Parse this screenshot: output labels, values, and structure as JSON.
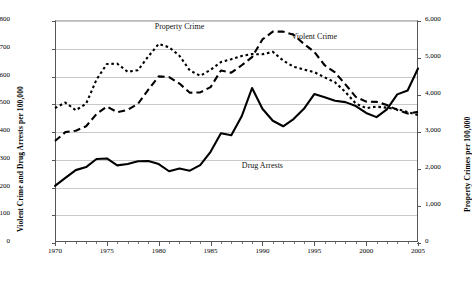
{
  "chart_data": {
    "type": "line",
    "title": "",
    "xlabel": "",
    "ylabel": "Violent Crime and Drug Arrests per 100,000",
    "y2label": "Property Crimes per 100,000",
    "xlim": [
      1970,
      2005
    ],
    "ylim": [
      0,
      800
    ],
    "y2lim": [
      0,
      6000
    ],
    "grid": true,
    "legend": "inline-annotations",
    "xticks": [
      1970,
      1975,
      1980,
      1985,
      1990,
      1995,
      2000,
      2005
    ],
    "xtick_labels": [
      "1970",
      "1975",
      "1980",
      "1985",
      "1990",
      "1995",
      "2000",
      "2005"
    ],
    "xtick_minor_step": 1,
    "yticks": [
      0,
      100,
      200,
      300,
      400,
      500,
      600,
      700,
      800
    ],
    "ytick_labels": [
      "0",
      "100",
      "200",
      "300",
      "400",
      "500",
      "600",
      "700",
      "800"
    ],
    "y2ticks": [
      0,
      1000,
      2000,
      3000,
      4000,
      5000,
      6000
    ],
    "y2tick_labels": [
      "0",
      "1,000",
      "2,000",
      "3,000",
      "4,000",
      "5,000",
      "6,000"
    ],
    "x": [
      1970,
      1971,
      1972,
      1973,
      1974,
      1975,
      1976,
      1977,
      1978,
      1979,
      1980,
      1981,
      1982,
      1983,
      1984,
      1985,
      1986,
      1987,
      1988,
      1989,
      1990,
      1991,
      1992,
      1993,
      1994,
      1995,
      1996,
      1997,
      1998,
      1999,
      2000,
      2001,
      2002,
      2003,
      2004,
      2005
    ],
    "series": [
      {
        "name": "Property Crime",
        "axis": "right",
        "style": "dotted",
        "units": "per 100,000",
        "values": [
          3621,
          3769,
          3561,
          3737,
          4390,
          4811,
          4820,
          4602,
          4643,
          5017,
          5353,
          5264,
          5033,
          4637,
          4492,
          4651,
          4863,
          4940,
          5027,
          5078,
          5073,
          5140,
          4903,
          4738,
          4660,
          4591,
          4451,
          4316,
          4053,
          3743,
          3618,
          3658,
          3631,
          3591,
          3514,
          3432
        ]
      },
      {
        "name": "Violent Crime",
        "axis": "left",
        "style": "dashed",
        "units": "per 100,000",
        "values": [
          364,
          396,
          401,
          417,
          461,
          488,
          468,
          476,
          498,
          549,
          597,
          594,
          571,
          538,
          539,
          558,
          618,
          610,
          637,
          666,
          730,
          758,
          758,
          747,
          714,
          685,
          637,
          611,
          568,
          523,
          506,
          505,
          494,
          476,
          463,
          469
        ]
      },
      {
        "name": "Drug Arrests",
        "axis": "left",
        "style": "solid",
        "units": "per 100,000",
        "values": [
          202,
          231,
          259,
          270,
          299,
          301,
          276,
          281,
          291,
          292,
          281,
          255,
          265,
          257,
          277,
          325,
          392,
          385,
          453,
          555,
          480,
          437,
          417,
          443,
          480,
          533,
          522,
          509,
          504,
          490,
          465,
          450,
          478,
          532,
          546,
          625
        ]
      }
    ],
    "annotations": [
      {
        "text": "Property Crime",
        "x": 1982,
        "y": 775,
        "axis": "left"
      },
      {
        "text": "Violent Crime",
        "x": 1995,
        "y": 740,
        "axis": "left"
      },
      {
        "text": "Drug Arrests",
        "x": 1990,
        "y": 275,
        "axis": "left"
      }
    ]
  }
}
